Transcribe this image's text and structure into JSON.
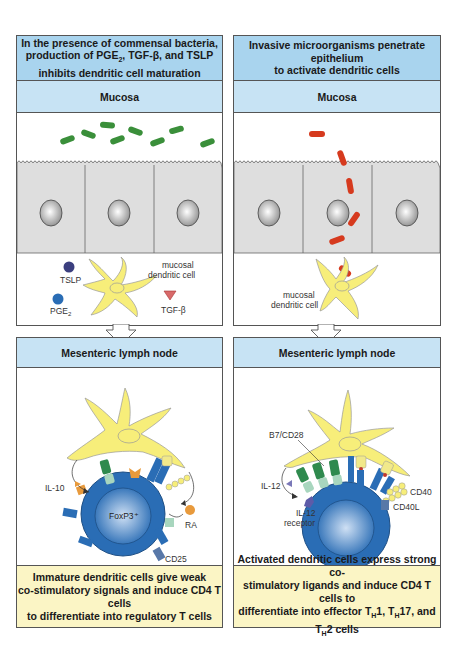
{
  "left_panel": {
    "title_line1": "In the presence of commensal bacteria,",
    "title_line2_pre": "production of PGE",
    "title_line2_sub": "2",
    "title_line2_post": ", TGF-β, and TSLP",
    "title_line3": "inhibits dendritic cell maturation",
    "mucosa_label": "Mucosa",
    "lymph_label": "Mesenteric lymph node",
    "labels": {
      "tslp": "TSLP",
      "pge": "PGE",
      "pge_sub": "2",
      "tgfb": "TGF-β",
      "dc_line1": "mucosal",
      "dc_line2": "dendritic cell",
      "il10": "IL-10",
      "foxp3": "FoxP3⁺",
      "ra": "RA",
      "cd25": "CD25"
    },
    "caption_line1": "Immature dendritic cells give weak",
    "caption_line2": "co-stimulatory signals and induce CD4 T cells",
    "caption_line3": "to differentiate into regulatory T cells"
  },
  "right_panel": {
    "title_line1": "Invasive microorganisms penetrate epithelium",
    "title_line2": "to activate dendritic cells",
    "mucosa_label": "Mucosa",
    "lymph_label": "Mesenteric lymph node",
    "labels": {
      "dc_line1": "mucosal",
      "dc_line2": "dendritic cell",
      "b7cd28": "B7/CD28",
      "il12": "IL-12",
      "il12r_line1": "IL-12",
      "il12r_line2": "receptor",
      "cd40": "CD40",
      "cd40l": "CD40L"
    },
    "caption_line1": "Activated dendritic cells express strong co-",
    "caption_line2": "stimulatory ligands and induce CD4 T cells to",
    "caption_line3_pre": "differentiate into effector T",
    "caption_th": "H",
    "caption_t1": "1, T",
    "caption_t2": "17, and T",
    "caption_t3": "2 cells"
  },
  "colors": {
    "title_bg": "#a9d4ee",
    "sub_bg": "#c7e3f4",
    "caption_bg": "#fbf5c5",
    "commensal_bacteria": "#3a8f3a",
    "invasive_bacteria": "#d63a1e",
    "dendritic_cell": "#f7ee7a",
    "t_cell": "#2a6db5",
    "epithelium": "#dedede"
  }
}
